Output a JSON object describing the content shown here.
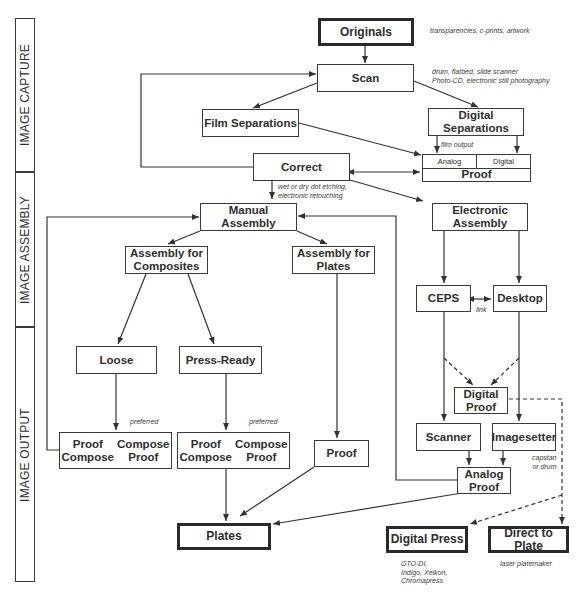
{
  "sections": [
    {
      "id": "capture",
      "label": "IMAGE CAPTURE"
    },
    {
      "id": "assembly",
      "label": "IMAGE ASSEMBLY"
    },
    {
      "id": "output",
      "label": "IMAGE OUTPUT"
    }
  ],
  "nodes": {
    "originals": "Originals",
    "scan": "Scan",
    "film_separations": "Film Separations",
    "digital_separations": "Digital\nSeparations",
    "proof_capture": {
      "analog": "Analog",
      "digital": "Digital",
      "label": "Proof"
    },
    "correct": "Correct",
    "manual_assembly": "Manual\nAssembly",
    "electronic_assembly": "Electronic\nAssembly",
    "assembly_composites": "Assembly for\nComposites",
    "assembly_plates": "Assembly for\nPlates",
    "ceps": "CEPS",
    "desktop": "Desktop",
    "loose": "Loose",
    "press_ready": "Press-Ready",
    "digital_proof": "Digital\nProof",
    "proof_compose_loose": {
      "left": "Proof\nCompose",
      "right": "Compose\nProof"
    },
    "proof_compose_press": {
      "left": "Proof\nCompose",
      "right": "Compose\nProof"
    },
    "proof_plates": "Proof",
    "scanner": "Scanner",
    "imagesetter": "Imagesetter",
    "analog_proof": "Analog\nProof",
    "plates": "Plates",
    "digital_press": "Digital Press",
    "direct_to_plate": "Direct to Plate"
  },
  "notes": {
    "originals": "transparencies, c-prints, artwork",
    "scan": "drum, flatbed, slide scanner\nPhoto-CD, electronic still photography",
    "film_output": "film output",
    "correct": "wet or dry dot etching,\nelectronic retouching",
    "link": "link",
    "preferred_loose": "preferred",
    "preferred_press": "preferred",
    "imagesetter": "capstan\nor drum",
    "digital_press": "GTO-DI,\nIndigo, Xeikon,\nChromapress",
    "direct_to_plate": "laser platemaker"
  }
}
